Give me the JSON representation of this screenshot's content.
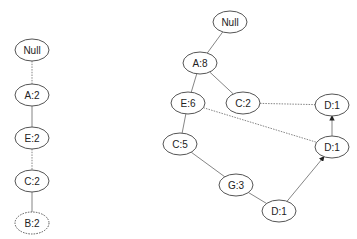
{
  "left_tree": {
    "nodes": [
      {
        "id": "l-null",
        "label": "Null",
        "x": 32,
        "y": 50
      },
      {
        "id": "l-a",
        "label": "A:2",
        "x": 32,
        "y": 95
      },
      {
        "id": "l-e",
        "label": "E:2",
        "x": 32,
        "y": 138
      },
      {
        "id": "l-c",
        "label": "C:2",
        "x": 32,
        "y": 181
      },
      {
        "id": "l-b",
        "label": "B:2",
        "x": 32,
        "y": 223
      }
    ],
    "edges": [
      {
        "from": "l-null",
        "to": "l-a",
        "style": "dotted"
      },
      {
        "from": "l-a",
        "to": "l-e",
        "style": "solid"
      },
      {
        "from": "l-e",
        "to": "l-c",
        "style": "dotted"
      },
      {
        "from": "l-c",
        "to": "l-b",
        "style": "solid"
      }
    ]
  },
  "right_tree": {
    "nodes": [
      {
        "id": "r-null",
        "label": "Null",
        "x": 230,
        "y": 22
      },
      {
        "id": "r-a",
        "label": "A:8",
        "x": 200,
        "y": 63
      },
      {
        "id": "r-e",
        "label": "E:6",
        "x": 188,
        "y": 103
      },
      {
        "id": "r-c2",
        "label": "C:2",
        "x": 243,
        "y": 103
      },
      {
        "id": "r-d1-top",
        "label": "D:1",
        "x": 332,
        "y": 105
      },
      {
        "id": "r-c5",
        "label": "C:5",
        "x": 180,
        "y": 144
      },
      {
        "id": "r-d1-mid",
        "label": "D:1",
        "x": 332,
        "y": 147
      },
      {
        "id": "r-g",
        "label": "G:3",
        "x": 236,
        "y": 185
      },
      {
        "id": "r-d1-bot",
        "label": "D:1",
        "x": 279,
        "y": 211
      }
    ],
    "edges": [
      {
        "from": "r-null",
        "to": "r-a",
        "style": "solid"
      },
      {
        "from": "r-a",
        "to": "r-e",
        "style": "solid"
      },
      {
        "from": "r-a",
        "to": "r-c2",
        "style": "solid"
      },
      {
        "from": "r-e",
        "to": "r-c5",
        "style": "solid"
      },
      {
        "from": "r-e",
        "to": "r-d1-mid",
        "style": "dotted"
      },
      {
        "from": "r-c2",
        "to": "r-d1-top",
        "style": "dotted"
      },
      {
        "from": "r-c5",
        "to": "r-g",
        "style": "solid"
      },
      {
        "from": "r-g",
        "to": "r-d1-bot",
        "style": "solid"
      },
      {
        "from": "r-d1-mid",
        "to": "r-d1-top",
        "style": "arrow"
      },
      {
        "from": "r-d1-bot",
        "to": "r-d1-mid",
        "style": "arrow"
      }
    ]
  },
  "colors": {
    "stroke": "#555555",
    "edge": "#777777",
    "text": "#222222",
    "background": "#ffffff"
  }
}
